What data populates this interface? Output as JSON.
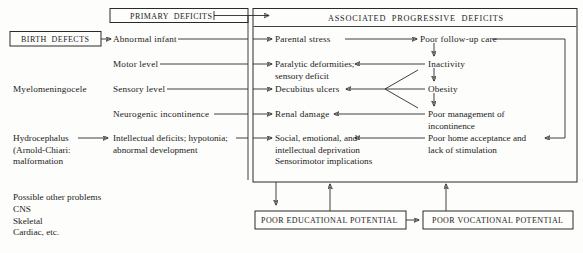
{
  "diagram": {
    "title_boxes": {
      "birth_defects": "BIRTH  DEFECTS",
      "primary_deficits": "PRIMARY  DEFICITS",
      "associated_progressive_deficits": "ASSOCIATED  PROGRESSIVE  DEFICITS",
      "poor_educational_potential": "POOR EDUCATIONAL POTENTIAL",
      "poor_vocational_potential": "POOR VOCATIONAL POTENTIAL"
    },
    "left_column": {
      "myelomeningocele": "Myelomeningocele",
      "hydrocephalus": "Hydrocephalus\n(Arnold-Chiari:\nmalformation",
      "possible_other_problems": "Possible other problems\n   CNS\n   Skeletal\n   Cardiac, etc."
    },
    "primary_deficits_items": [
      "Abnormal infant",
      "Motor level",
      "Sensory level",
      "Neurogenic incontinence",
      "Intellectual deficits; hypotonia;\nabnormal development"
    ],
    "associated_left_items": [
      "Parental stress",
      "Paralytic deformities;\nsensory deficit",
      "Decubitus ulcers",
      "Renal damage",
      "Social, emotional, and\nintellectual deprivation\nSensorimotor implications"
    ],
    "associated_right_items": [
      "Poor follow-up care",
      "Inactivity",
      "Obesity",
      "Poor management of\nincontinence",
      "Poor home acceptance and\nlack of stimulation"
    ],
    "colors": {
      "ink": "#2a2a2a",
      "paper": "#fdfdfb"
    }
  }
}
